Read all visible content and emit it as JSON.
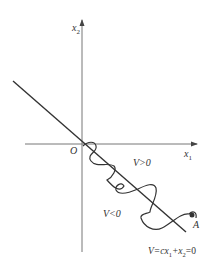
{
  "diagram": {
    "axes": {
      "x_label": "x",
      "x_sub": "1",
      "y_label": "x",
      "y_sub": "2",
      "origin_label": "O"
    },
    "regions": {
      "positive": "V>0",
      "negative": "V<0"
    },
    "switching_line": {
      "label": "V=cx",
      "label_sub": "1",
      "label_rest": "+x",
      "label_sub2": "2",
      "label_end": "=0"
    },
    "point": {
      "label": "A"
    },
    "colors": {
      "line": "#333333",
      "axis": "#555555"
    }
  }
}
